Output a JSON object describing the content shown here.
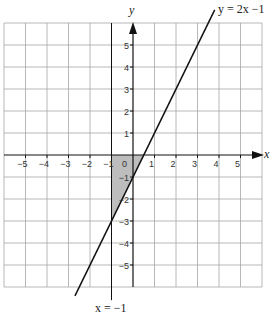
{
  "chart_data": {
    "type": "line",
    "title": "",
    "xlabel": "x",
    "ylabel": "y",
    "xlim": [
      -6,
      6
    ],
    "ylim": [
      -6,
      6
    ],
    "grid": true,
    "x_ticks": [
      -5,
      -4,
      -3,
      -2,
      -1,
      0,
      1,
      2,
      3,
      4,
      5
    ],
    "y_ticks": [
      -5,
      -4,
      -3,
      -2,
      -1,
      1,
      2,
      3,
      4,
      5
    ],
    "series": [
      {
        "name": "y = 2x −1",
        "equation": "y = 2x - 1",
        "x": [
          -2.7,
          3.8
        ],
        "y": [
          -6.4,
          6.6
        ]
      },
      {
        "name": "x = −1",
        "equation": "x = -1",
        "x": [
          -1,
          -1
        ],
        "y": [
          -6.6,
          6
        ]
      }
    ],
    "shaded_region": {
      "description": "Region bounded by x = -1, y = 0 and y = 2x - 1",
      "vertices": [
        [
          -1,
          0
        ],
        [
          0.5,
          0
        ],
        [
          -1,
          -3
        ]
      ],
      "color": "#bdbdbd"
    },
    "annotations": [
      {
        "text": "y = 2x −1",
        "position": "top-right, end of line"
      },
      {
        "text": "x = −1",
        "position": "bottom, below vertical line"
      }
    ]
  },
  "labels": {
    "x_axis": "x",
    "y_axis": "y",
    "line_label": "y = 2x −1",
    "vline_label": "x = −1",
    "origin": "0",
    "x_ticks": [
      "−5",
      "−4",
      "−3",
      "−2",
      "−1",
      "1",
      "2",
      "3",
      "4",
      "5"
    ],
    "y_ticks": [
      "5",
      "4",
      "3",
      "2",
      "1",
      "−1",
      "−2",
      "−3",
      "−4",
      "−5"
    ]
  },
  "colors": {
    "grid": "#a6a6a6",
    "axis": "#111111",
    "line": "#111111",
    "shade": "#bdbdbd"
  }
}
